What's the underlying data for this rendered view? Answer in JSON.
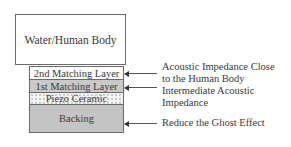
{
  "diagram": {
    "medium": "Water/Human Body",
    "layers": [
      {
        "name": "2nd Matching Layer",
        "fill": "#ffffff"
      },
      {
        "name": "1st Matching Layer",
        "fill": "#c9c9c9"
      },
      {
        "name": "Piezo Ceramic",
        "fill": "dotted"
      },
      {
        "name": "Backing",
        "fill": "#c4c4c4"
      }
    ],
    "annotations": [
      {
        "target": "2nd Matching Layer",
        "line1": "Acoustic Impedance Close",
        "line2": "to the Human Body"
      },
      {
        "target": "1st Matching Layer",
        "line1": "Intermediate Acoustic",
        "line2": "Impedance"
      },
      {
        "target": "Backing",
        "line1": "Reduce the Ghost Effect"
      }
    ]
  }
}
